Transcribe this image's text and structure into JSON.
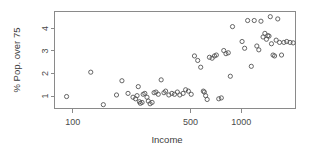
{
  "figure": {
    "background_color": "#ffffff",
    "frame_color": "#8a8a8a",
    "marker_color": "#555555",
    "text_color": "#4a4a4a"
  },
  "chart_data": {
    "type": "scatter",
    "title": "",
    "xlabel": "Income",
    "ylabel": "% Pop. over 75",
    "xscale": "log",
    "yscale": "linear",
    "grid": false,
    "legend": null,
    "marker": "open-circle",
    "xlim": [
      78,
      2100
    ],
    "ylim": [
      0.45,
      4.75
    ],
    "xticks": [
      100,
      500,
      1000
    ],
    "xtick_labels": [
      "100",
      "500",
      "1000"
    ],
    "yticks": [
      1,
      2,
      3,
      4
    ],
    "ytick_labels": [
      "1",
      "2",
      "3",
      "4"
    ],
    "x": [
      92,
      128,
      152,
      182,
      196,
      213,
      228,
      236,
      241,
      245,
      249,
      252,
      258,
      262,
      268,
      276,
      281,
      288,
      296,
      304,
      312,
      322,
      335,
      348,
      356,
      372,
      388,
      402,
      418,
      432,
      452,
      468,
      486,
      505,
      528,
      552,
      575,
      596,
      604,
      615,
      628,
      648,
      672,
      694,
      712,
      736,
      762,
      788,
      812,
      838,
      862,
      888,
      1012,
      1048,
      1092,
      1148,
      1195,
      1238,
      1272,
      1310,
      1348,
      1382,
      1412,
      1438,
      1462,
      1488,
      1512,
      1545,
      1578,
      1612,
      1648,
      1688,
      1735,
      1792,
      1862,
      1948,
      2035
    ],
    "y": [
      0.98,
      2.06,
      0.62,
      1.05,
      1.68,
      1.12,
      0.95,
      0.88,
      1.02,
      1.42,
      0.75,
      0.68,
      0.72,
      1.08,
      1.12,
      0.95,
      0.78,
      0.66,
      0.72,
      1.15,
      1.18,
      1.08,
      1.72,
      1.15,
      1.22,
      1.05,
      1.12,
      1.08,
      1.18,
      1.05,
      1.12,
      1.28,
      1.22,
      1.08,
      2.78,
      2.58,
      2.28,
      1.22,
      1.18,
      1.02,
      0.85,
      2.72,
      2.68,
      2.78,
      2.82,
      0.88,
      0.92,
      3.02,
      2.88,
      2.92,
      1.88,
      4.08,
      3.42,
      3.12,
      4.35,
      2.32,
      4.35,
      3.22,
      3.05,
      4.32,
      3.62,
      3.78,
      3.52,
      3.68,
      3.66,
      4.52,
      3.32,
      2.82,
      2.78,
      3.48,
      4.42,
      3.38,
      2.82,
      3.38,
      3.42,
      3.38,
      3.36
    ]
  }
}
